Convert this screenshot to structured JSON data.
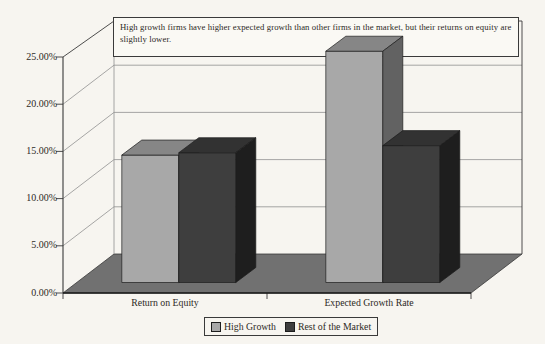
{
  "page": {
    "background": "#f7f5f0"
  },
  "chart_data": {
    "type": "bar",
    "style": "3d-clustered-column",
    "annotation": "High growth firms have higher expected growth than other firms in the market, but their returns on equity are slightly lower.",
    "categories": [
      "Return on Equity",
      "Expected Growth Rate"
    ],
    "series": [
      {
        "name": "High Growth",
        "values": [
          13.5,
          24.5
        ],
        "color": "#a8a8a8"
      },
      {
        "name": "Rest of the Market",
        "values": [
          13.75,
          14.5
        ],
        "color": "#3e3e3e"
      }
    ],
    "value_axis": {
      "min": 0,
      "max": 25,
      "step": 5,
      "tick_labels": [
        "0.00%",
        "5.00%",
        "10.00%",
        "15.00%",
        "20.00%",
        "25.00%"
      ]
    },
    "legend": {
      "position": "bottom",
      "items": [
        "High Growth",
        "Rest of the Market"
      ]
    },
    "grid": true
  },
  "colors": {
    "paper": "#f7f5f0",
    "floor": "#717171",
    "gridline": "#909090",
    "outline": "#3a3a3a",
    "bar_edge": "#1c1c1c",
    "text": "#2d2a25",
    "series_faces": [
      {
        "front": "#a8a8a8",
        "top": "#868686",
        "side": "#626262"
      },
      {
        "front": "#3e3e3e",
        "top": "#323232",
        "side": "#1e1e1e"
      }
    ]
  }
}
